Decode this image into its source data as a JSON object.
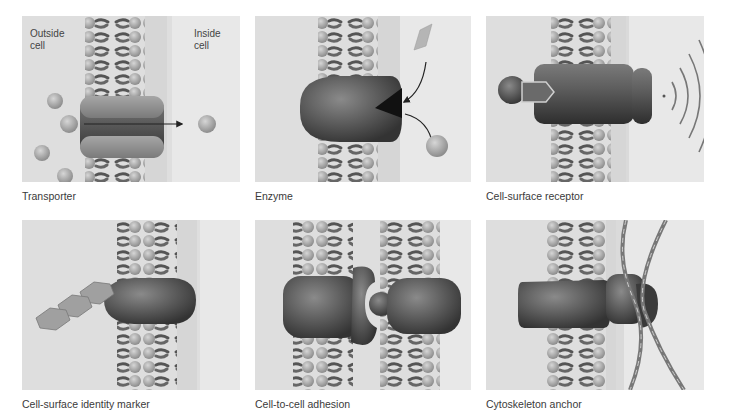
{
  "figure": {
    "panels": [
      {
        "id": "transporter",
        "caption": "Transporter",
        "labels": {
          "outside": "Outside\ncell",
          "inside": "Inside\ncell"
        }
      },
      {
        "id": "enzyme",
        "caption": "Enzyme"
      },
      {
        "id": "cell-surface-receptor",
        "caption": "Cell-surface receptor"
      },
      {
        "id": "cell-surface-identity-marker",
        "caption": "Cell-surface identity marker"
      },
      {
        "id": "cell-to-cell-adhesion",
        "caption": "Cell-to-cell adhesion"
      },
      {
        "id": "cytoskeleton-anchor",
        "caption": "Cytoskeleton anchor"
      }
    ],
    "colors": {
      "background": "#ffffff",
      "panel": "#dedede",
      "panel_inside": "#e8e8e8",
      "lipid_head": "#a8a8a8",
      "lipid_tail": "#555555",
      "protein_dark": "#4a4a4a",
      "protein_light": "#8a8a8a",
      "caption_text": "#3a3a3a"
    }
  }
}
